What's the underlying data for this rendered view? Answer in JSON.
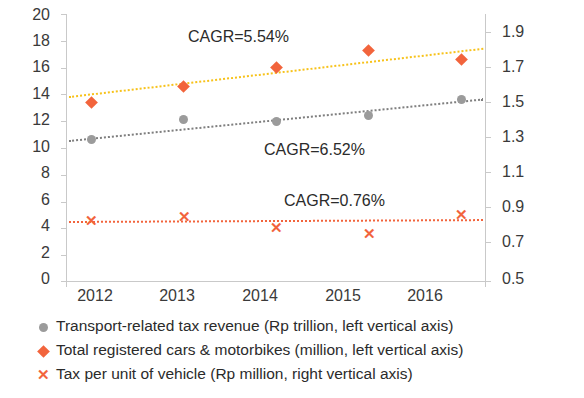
{
  "chart_data": {
    "type": "scatter",
    "title": "",
    "xlabel": "",
    "ylabel": "",
    "categories": [
      "2012",
      "2013",
      "2014",
      "2015",
      "2016"
    ],
    "left_axis": {
      "label": "left vertical axis",
      "ylim": [
        0,
        20
      ],
      "ticks": [
        "0",
        "2",
        "4",
        "6",
        "8",
        "10",
        "12",
        "14",
        "16",
        "18",
        "20"
      ]
    },
    "right_axis": {
      "label": "right vertical axis",
      "ylim": [
        0.5,
        1.9
      ],
      "ticks": [
        "0.5",
        "0.7",
        "0.9",
        "1.1",
        "1.3",
        "1.5",
        "1.7",
        "1.9"
      ]
    },
    "grid": false,
    "legend_position": "bottom",
    "series": [
      {
        "name": "Transport-related tax revenue (Rp trillion, left vertical axis)",
        "marker": "dot",
        "color": "#9b9b9b",
        "axis": "left",
        "values": [
          10.6,
          12.1,
          12.0,
          12.4,
          13.6
        ],
        "trend_label": "CAGR=6.52%",
        "trend_from": 10.6,
        "trend_to": 13.7
      },
      {
        "name": "Total registered cars & motorbikes (million, left vertical axis)",
        "marker": "diamond",
        "color": "#f2643c",
        "axis": "left",
        "values": [
          13.4,
          14.6,
          16.0,
          17.3,
          16.6
        ],
        "trend_label": "CAGR=5.54%",
        "trend_from": 13.9,
        "trend_to": 17.5
      },
      {
        "name": "Tax per unit of vehicle (Rp million, right vertical axis)",
        "marker": "cross",
        "color": "#f2643c",
        "axis": "right",
        "values": [
          0.82,
          0.84,
          0.78,
          0.75,
          0.85
        ],
        "trend_label": "CAGR=0.76%",
        "trend_from": 0.82,
        "trend_to": 0.83
      }
    ],
    "annotations": [
      {
        "text": "CAGR=5.54%",
        "x": 0.32,
        "y": 0.93
      },
      {
        "text": "CAGR=6.52%",
        "x": 0.5,
        "y": 0.42
      },
      {
        "text": "CAGR=0.76%",
        "x": 0.5,
        "y": 0.23
      }
    ]
  },
  "legend": [
    {
      "marker": "dot",
      "label": "Transport-related tax revenue (Rp trillion, left vertical axis)"
    },
    {
      "marker": "diamond",
      "label": "Total registered cars & motorbikes (million, left vertical axis)"
    },
    {
      "marker": "cross",
      "label": "Tax per unit of vehicle (Rp million, right vertical axis)"
    }
  ]
}
